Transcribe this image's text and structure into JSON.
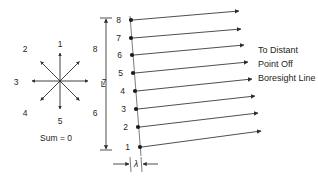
{
  "figure": {
    "background_color": "#ffffff",
    "line_color": "#3b3b3b",
    "text_color": "#231f20"
  },
  "star_diagram": {
    "name": "eight-vector-sum-star",
    "center": {
      "x": 60,
      "y": 81
    },
    "radius": 26,
    "sum_label": "Sum = 0",
    "vectors": [
      {
        "label": "1",
        "angle_deg": 90,
        "label_x": 60,
        "label_y": 44
      },
      {
        "label": "2",
        "angle_deg": 135,
        "label_x": 23,
        "label_y": 50
      },
      {
        "label": "3",
        "angle_deg": 180,
        "label_x": 13,
        "label_y": 84
      },
      {
        "label": "4",
        "angle_deg": 225,
        "label_x": 23,
        "label_y": 117
      },
      {
        "label": "5",
        "angle_deg": 270,
        "label_x": 60,
        "label_y": 125
      },
      {
        "label": "6",
        "angle_deg": 315,
        "label_x": 96,
        "label_y": 117
      },
      {
        "label": "7",
        "angle_deg": 0,
        "label_x": 105,
        "label_y": 84
      },
      {
        "label": "8",
        "angle_deg": 45,
        "label_x": 96,
        "label_y": 50
      }
    ]
  },
  "array_diagram": {
    "name": "linear-array-wavefront",
    "dimension_label": "L",
    "spacing_label": "λ",
    "element_count": 8,
    "elements": [
      {
        "label": "8",
        "dot_x": 131,
        "dot_y": 20,
        "ray_end_x": 240,
        "ray_end_y": 11
      },
      {
        "label": "7",
        "dot_x": 130,
        "dot_y": 38,
        "ray_end_x": 242,
        "ray_end_y": 29
      },
      {
        "label": "6",
        "dot_x": 132,
        "dot_y": 55,
        "ray_end_x": 245,
        "ray_end_y": 45
      },
      {
        "label": "5",
        "dot_x": 133,
        "dot_y": 73,
        "ray_end_x": 249,
        "ray_end_y": 62
      },
      {
        "label": "4",
        "dot_x": 135,
        "dot_y": 91,
        "ray_end_x": 253,
        "ray_end_y": 79
      },
      {
        "label": "3",
        "dot_x": 136,
        "dot_y": 109,
        "ray_end_x": 256,
        "ray_end_y": 96
      },
      {
        "label": "2",
        "dot_x": 138,
        "dot_y": 127,
        "ray_end_x": 259,
        "ray_end_y": 113
      },
      {
        "label": "1",
        "dot_x": 140,
        "dot_y": 147,
        "ray_end_x": 262,
        "ray_end_y": 131
      }
    ],
    "dimension_line": {
      "x": 106,
      "y_top": 18,
      "y_bottom": 150
    },
    "spacing_bracket": {
      "y": 164,
      "x_left": 119,
      "x_right": 152,
      "tick_x": 136
    },
    "caption_lines": [
      "To Distant",
      "Point Off",
      "Boresight Line"
    ],
    "caption_x": 258,
    "caption_y_first": 52
  }
}
